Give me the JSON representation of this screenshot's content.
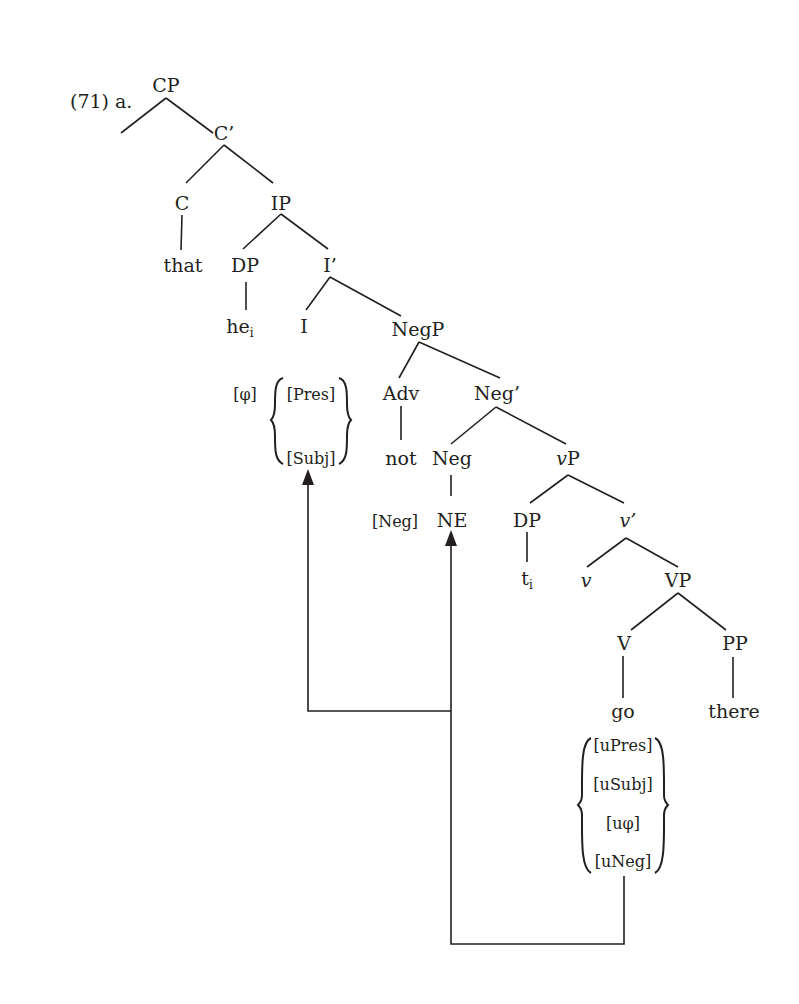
{
  "example_label": "(71) a.",
  "nodes": {
    "cp": "CP",
    "c_bar": "C’",
    "c": "C",
    "ip": "IP",
    "that": "that",
    "dp_subj": "DP",
    "i_bar": "I’",
    "he": "he",
    "he_index": "i",
    "i": "I",
    "negp": "NegP",
    "adv": "Adv",
    "neg_bar": "Neg’",
    "not": "not",
    "neg": "Neg",
    "vp_small": "vP",
    "vp_small_v": "v",
    "vp_small_p": "P",
    "ne": "NE",
    "dp_trace": "DP",
    "trace": "t",
    "trace_index": "i",
    "v_bar": "v’",
    "v_small": "v",
    "vp": "VP",
    "v": "V",
    "pp": "PP",
    "go": "go",
    "there": "there"
  },
  "features": {
    "i_phi": "[φ]",
    "i_set": [
      "[Pres]",
      "[Subj]"
    ],
    "neg_feature": "[Neg]",
    "go_set": [
      "[uPres]",
      "[uSubj]",
      "[uφ]",
      "[uNeg]"
    ]
  },
  "arrows": [
    {
      "from": "go_set",
      "to": "NE",
      "label": "agree-neg"
    },
    {
      "from": "go_set",
      "to": "[Subj]",
      "label": "agree-subj"
    }
  ]
}
